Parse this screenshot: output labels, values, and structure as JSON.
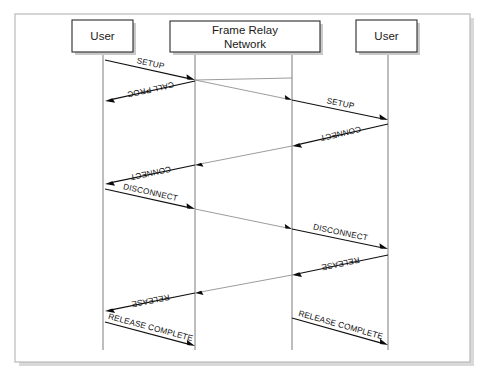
{
  "diagram": {
    "frame": {
      "x": 15,
      "y": 14,
      "width": 455,
      "height": 348
    },
    "colors": {
      "background": "#ffffff",
      "frame_border": "#b9b9b9",
      "actor_border": "#2b2b2b",
      "lifeline": "#7d7d7d",
      "message_solid": "#101010",
      "message_thin": "#8a8a8a",
      "text": "#111111"
    },
    "actors": [
      {
        "id": "user-left",
        "label": "User",
        "box": {
          "x": 72,
          "y": 20,
          "w": 61,
          "h": 32
        },
        "lifelines": [
          103
        ]
      },
      {
        "id": "network",
        "label": "Frame Relay\nNetwork",
        "label_line1": "Frame Relay",
        "label_line2": "Network",
        "box": {
          "x": 170,
          "y": 21,
          "w": 150,
          "h": 31
        },
        "lifelines": [
          195,
          292
        ]
      },
      {
        "id": "user-right",
        "label": "User",
        "box": {
          "x": 356,
          "y": 20,
          "w": 61,
          "h": 32
        },
        "lifelines": [
          388
        ]
      }
    ],
    "lifeline_top": 52,
    "lifeline_bottom": 350,
    "messages": [
      {
        "id": "setup-left",
        "label": "SETUP",
        "from_x": 105,
        "from_y": 60,
        "to_x": 195,
        "to_y": 80,
        "style": "solid",
        "arrow": true,
        "label_dx": 0,
        "label_dy": -4
      },
      {
        "id": "setup-transit",
        "label": "",
        "from_x": 195,
        "from_y": 80,
        "to_x": 292,
        "to_y": 100,
        "style": "thin",
        "arrow": true,
        "label_dx": 0,
        "label_dy": -4
      },
      {
        "id": "setup-right",
        "label": "SETUP",
        "from_x": 292,
        "from_y": 100,
        "to_x": 388,
        "to_y": 120,
        "style": "solid",
        "arrow": true,
        "label_dx": 0,
        "label_dy": -4
      },
      {
        "id": "call-proc-transit",
        "label": "",
        "from_x": 292,
        "from_y": 78,
        "to_x": 195,
        "to_y": 80,
        "style": "thin",
        "arrow": false,
        "label_dx": 0,
        "label_dy": -4
      },
      {
        "id": "call-proc-left",
        "label": "CALL PROC",
        "from_x": 195,
        "from_y": 81,
        "to_x": 105,
        "to_y": 101,
        "style": "solid",
        "arrow": true,
        "label_dx": 0,
        "label_dy": -4
      },
      {
        "id": "connect-right",
        "label": "CONNECT",
        "from_x": 388,
        "from_y": 124,
        "to_x": 292,
        "to_y": 146,
        "style": "solid",
        "arrow": true,
        "label_dx": 0,
        "label_dy": -4
      },
      {
        "id": "connect-transit",
        "label": "",
        "from_x": 292,
        "from_y": 146,
        "to_x": 195,
        "to_y": 165,
        "style": "thin",
        "arrow": true,
        "label_dx": 0,
        "label_dy": -4
      },
      {
        "id": "connect-left",
        "label": "CONNECT",
        "from_x": 195,
        "from_y": 165,
        "to_x": 105,
        "to_y": 184,
        "style": "solid",
        "arrow": true,
        "label_dx": 0,
        "label_dy": -4
      },
      {
        "id": "disconnect-left",
        "label": "DISCONNECT",
        "from_x": 105,
        "from_y": 189,
        "to_x": 195,
        "to_y": 209,
        "style": "solid",
        "arrow": true,
        "label_dx": 0,
        "label_dy": -4
      },
      {
        "id": "disconnect-transit",
        "label": "",
        "from_x": 195,
        "from_y": 209,
        "to_x": 292,
        "to_y": 229,
        "style": "thin",
        "arrow": true,
        "label_dx": 0,
        "label_dy": -4
      },
      {
        "id": "disconnect-right",
        "label": "DISCONNECT",
        "from_x": 292,
        "from_y": 229,
        "to_x": 388,
        "to_y": 249,
        "style": "solid",
        "arrow": true,
        "label_dx": 0,
        "label_dy": -4
      },
      {
        "id": "release-right",
        "label": "RELEASE",
        "from_x": 388,
        "from_y": 255,
        "to_x": 292,
        "to_y": 275,
        "style": "solid",
        "arrow": true,
        "label_dx": 0,
        "label_dy": -4
      },
      {
        "id": "release-transit",
        "label": "",
        "from_x": 292,
        "from_y": 275,
        "to_x": 195,
        "to_y": 293,
        "style": "thin",
        "arrow": true,
        "label_dx": 0,
        "label_dy": -4
      },
      {
        "id": "release-left",
        "label": "RELEASE",
        "from_x": 195,
        "from_y": 293,
        "to_x": 105,
        "to_y": 311,
        "style": "solid",
        "arrow": true,
        "label_dx": 0,
        "label_dy": -4
      },
      {
        "id": "release-complete-left",
        "label": "RELEASE COMPLETE",
        "from_x": 105,
        "from_y": 322,
        "to_x": 195,
        "to_y": 346,
        "style": "solid",
        "arrow": true,
        "label_dx": 0,
        "label_dy": -4
      },
      {
        "id": "release-complete-right",
        "label": "RELEASE COMPLETE",
        "from_x": 292,
        "from_y": 318,
        "to_x": 388,
        "to_y": 345,
        "style": "solid",
        "arrow": true,
        "label_dx": 0,
        "label_dy": -4
      }
    ]
  }
}
